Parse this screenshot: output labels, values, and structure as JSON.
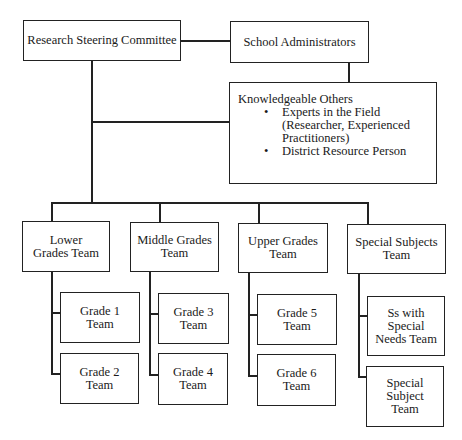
{
  "diagram": {
    "top": {
      "steering": "Research Steering Committee",
      "admins": "School Administrators"
    },
    "knowledgeable": {
      "title": "Knowledgeable Others",
      "items": [
        "Experts in the Field (Researcher, Experienced Practitioners)",
        "District Resource Person"
      ]
    },
    "teams": [
      {
        "label": "Lower Grades Team",
        "children": [
          "Grade 1 Team",
          "Grade 2 Team"
        ]
      },
      {
        "label": "Middle Grades Team",
        "children": [
          "Grade 3 Team",
          "Grade 4 Team"
        ]
      },
      {
        "label": "Upper Grades Team",
        "children": [
          "Grade 5 Team",
          "Grade 6 Team"
        ]
      },
      {
        "label": "Special Subjects Team",
        "children": [
          "Ss with Special Needs Team",
          "Special Subject Team"
        ]
      }
    ]
  }
}
